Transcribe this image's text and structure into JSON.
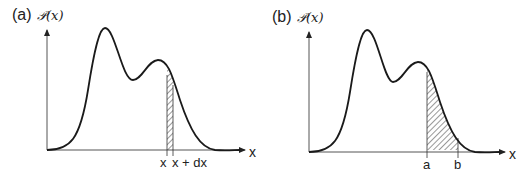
{
  "panels": [
    {
      "id": "a",
      "label": "(a)",
      "y_axis_label": "𝒫(x)",
      "x_axis_label": "x",
      "tick_labels": [
        "x",
        "x + dx"
      ],
      "shading": "narrow strip between x and x + dx"
    },
    {
      "id": "b",
      "label": "(b)",
      "y_axis_label": "𝒫(x)",
      "x_axis_label": "x",
      "tick_labels": [
        "a",
        "b"
      ],
      "shading": "area under curve between a and b"
    }
  ],
  "colors": {
    "line": "#1a1a1a",
    "hatch": "#333333",
    "background": "#ffffff"
  }
}
